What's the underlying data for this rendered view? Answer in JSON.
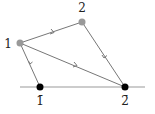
{
  "diagram": {
    "type": "directed-graph",
    "nodes": [
      {
        "id": "g1",
        "label": "1",
        "style": "gray",
        "x": 20,
        "y": 43,
        "label_x": 8,
        "label_y": 48
      },
      {
        "id": "g2",
        "label": "2",
        "style": "gray",
        "x": 82,
        "y": 22,
        "label_x": 82,
        "label_y": 12
      },
      {
        "id": "b1",
        "label": "1̄",
        "style": "black",
        "x": 40,
        "y": 87,
        "label_x": 40,
        "label_y": 105
      },
      {
        "id": "b2",
        "label": "2̄",
        "style": "black",
        "x": 125,
        "y": 87,
        "label_x": 125,
        "label_y": 105
      }
    ],
    "edges": [
      {
        "from": "b1",
        "to": "g1",
        "arrow": "mid"
      },
      {
        "from": "g1",
        "to": "g2",
        "arrow": "mid"
      },
      {
        "from": "g1",
        "to": "b2",
        "arrow": "mid"
      },
      {
        "from": "g2",
        "to": "b2",
        "arrow": "mid"
      }
    ],
    "baseline": {
      "x1": 20,
      "y1": 87,
      "x2": 145,
      "y2": 87
    },
    "colors": {
      "gray_node": "#999999",
      "black_node": "#000000",
      "edge": "#777777",
      "baseline": "#999999"
    }
  }
}
